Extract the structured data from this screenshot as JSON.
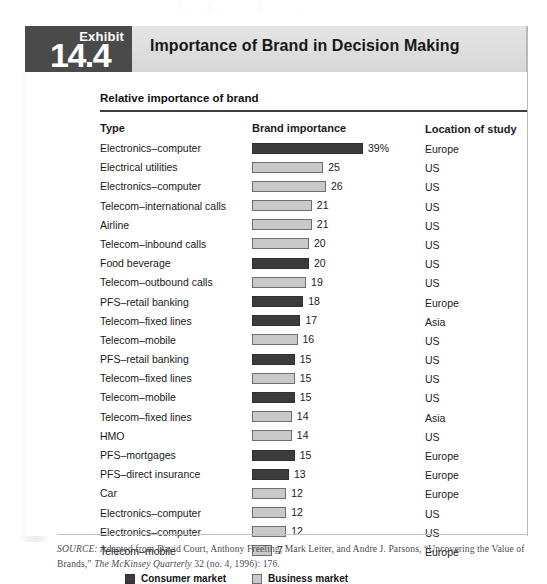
{
  "page": {
    "bleed_text": "|   .  .  |  . .   . . |  .  . . ."
  },
  "exhibit": {
    "label": "Exhibit",
    "number": "14.4",
    "title": "Importance of Brand in Decision Making",
    "section_title": "Relative importance of brand"
  },
  "columns": {
    "type": "Type",
    "brand_importance": "Brand importance",
    "location": "Location of study"
  },
  "legend": {
    "consumer": "Consumer market",
    "business": "Business market"
  },
  "colors": {
    "consumer_bar": "#3b3b3b",
    "business_bar": "#c9c9c9",
    "banner": "#dedede",
    "exhibit_tab": "#4a4a4a",
    "rule": "#3d3d3d"
  },
  "source": {
    "prefix": "SOURCE:",
    "text_1": " Adapted from David Court, Anthony Freeling, Mark Leiter, and Andre J. Parsons, “Uncovering the Value of Brands,” ",
    "italic": "The McKinsey Quarterly",
    "text_2": " 32 (no. 4, 1996): 176."
  },
  "chart_data": {
    "type": "bar",
    "title": "Importance of Brand in Decision Making",
    "subtitle": "Relative importance of brand",
    "orientation": "horizontal",
    "xlabel": "Brand importance",
    "ylabel": "Type",
    "value_unit": "percent",
    "xlim": [
      0,
      39
    ],
    "grid": false,
    "legend_position": "bottom-left",
    "series": [
      {
        "name": "Consumer market",
        "color": "#3b3b3b"
      },
      {
        "name": "Business market",
        "color": "#c9c9c9"
      }
    ],
    "categories": [
      "Electronics–computer",
      "Electrical utilities",
      "Electronics–computer",
      "Telecom–international calls",
      "Airline",
      "Telecom–inbound calls",
      "Food beverage",
      "Telecom–outbound calls",
      "PFS–retail banking",
      "Telecom–fixed lines",
      "Telecom–mobile",
      "PFS–retail banking",
      "Telecom–fixed lines",
      "Telecom–mobile",
      "Telecom–fixed lines",
      "HMO",
      "PFS–mortgages",
      "PFS–direct insurance",
      "Car",
      "Electronics–computer",
      "Electronics–computer",
      "Telecom–mobile"
    ],
    "values": [
      39,
      25,
      26,
      21,
      21,
      20,
      20,
      19,
      18,
      17,
      16,
      15,
      15,
      15,
      14,
      14,
      15,
      13,
      12,
      12,
      12,
      7
    ],
    "rows": [
      {
        "type": "Electronics–computer",
        "value": 39,
        "label": "39%",
        "market": "consumer",
        "location": "Europe"
      },
      {
        "type": "Electrical utilities",
        "value": 25,
        "label": "25",
        "market": "business",
        "location": "US"
      },
      {
        "type": "Electronics–computer",
        "value": 26,
        "label": "26",
        "market": "business",
        "location": "US"
      },
      {
        "type": "Telecom–international calls",
        "value": 21,
        "label": "21",
        "market": "business",
        "location": "US"
      },
      {
        "type": "Airline",
        "value": 21,
        "label": "21",
        "market": "business",
        "location": "US"
      },
      {
        "type": "Telecom–inbound calls",
        "value": 20,
        "label": "20",
        "market": "business",
        "location": "US"
      },
      {
        "type": "Food beverage",
        "value": 20,
        "label": "20",
        "market": "consumer",
        "location": "US"
      },
      {
        "type": "Telecom–outbound calls",
        "value": 19,
        "label": "19",
        "market": "business",
        "location": "US"
      },
      {
        "type": "PFS–retail banking",
        "value": 18,
        "label": "18",
        "market": "consumer",
        "location": "Europe"
      },
      {
        "type": "Telecom–fixed lines",
        "value": 17,
        "label": "17",
        "market": "consumer",
        "location": "Asia"
      },
      {
        "type": "Telecom–mobile",
        "value": 16,
        "label": "16",
        "market": "business",
        "location": "US"
      },
      {
        "type": "PFS–retail banking",
        "value": 15,
        "label": "15",
        "market": "consumer",
        "location": "US"
      },
      {
        "type": "Telecom–fixed lines",
        "value": 15,
        "label": "15",
        "market": "business",
        "location": "US"
      },
      {
        "type": "Telecom–mobile",
        "value": 15,
        "label": "15",
        "market": "consumer",
        "location": "US"
      },
      {
        "type": "Telecom–fixed lines",
        "value": 14,
        "label": "14",
        "market": "business",
        "location": "Asia"
      },
      {
        "type": "HMO",
        "value": 14,
        "label": "14",
        "market": "business",
        "location": "US"
      },
      {
        "type": "PFS–mortgages",
        "value": 15,
        "label": "15",
        "market": "consumer",
        "location": "Europe"
      },
      {
        "type": "PFS–direct insurance",
        "value": 13,
        "label": "13",
        "market": "consumer",
        "location": "Europe"
      },
      {
        "type": "Car",
        "value": 12,
        "label": "12",
        "market": "business",
        "location": "Europe"
      },
      {
        "type": "Electronics–computer",
        "value": 12,
        "label": "12",
        "market": "business",
        "location": "US"
      },
      {
        "type": "Electronics–computer",
        "value": 12,
        "label": "12",
        "market": "business",
        "location": "US"
      },
      {
        "type": "Telecom–mobile",
        "value": 7,
        "label": "7",
        "market": "business",
        "location": "Europe"
      }
    ]
  }
}
